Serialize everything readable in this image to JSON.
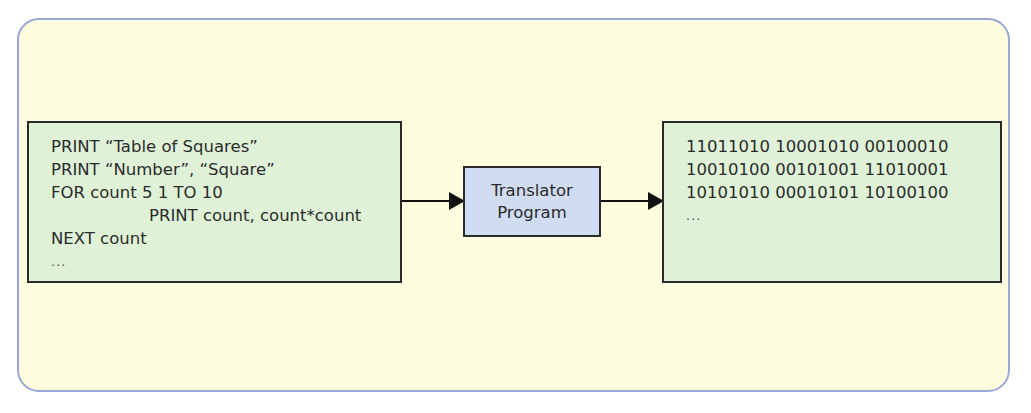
{
  "diagram": {
    "source_code": {
      "lines": [
        "PRINT “Table of Squares”",
        "PRINT “Number”, “Square”",
        "FOR count 5 1 TO 10",
        "PRINT count, count*count",
        "NEXT count",
        "..."
      ]
    },
    "translator": {
      "line1": "Translator",
      "line2": "Program"
    },
    "machine_code": {
      "lines": [
        "11011010 10001010 00100010",
        "10010100 00101001 11010001",
        "10101010 00010101 10100100",
        "..."
      ]
    },
    "colors": {
      "frame_bg": "#fffde0",
      "frame_border": "#98a6d8",
      "code_box_bg": "#dff2d8",
      "translator_bg": "#cfdcf2",
      "stroke": "#2a2a2a"
    }
  }
}
